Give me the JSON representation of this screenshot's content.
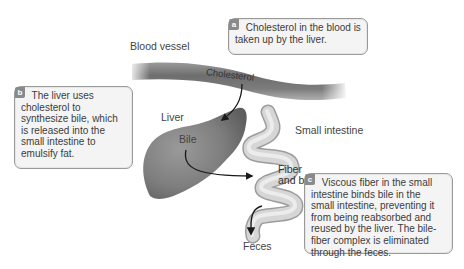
{
  "labels": {
    "blood_vessel": "Blood vessel",
    "cholesterol": "Cholesterol",
    "liver": "Liver",
    "bile": "Bile",
    "small_intestine": "Small intestine",
    "fiber_and_bile_line1": "Fiber",
    "fiber_and_bile_line2": "and bile",
    "feces": "Feces"
  },
  "callouts": {
    "a": {
      "badge": "a",
      "text": "Cholesterol in the blood is taken up by the liver."
    },
    "b": {
      "badge": "b",
      "text": "The liver uses cholesterol to synthesize bile, which is released into the small intestine to emulsify fat."
    },
    "c": {
      "badge": "c",
      "text": "Viscous fiber in the small intestine binds bile in the small intestine, preventing it from being reabsorbed and reused by the liver. The bile-fiber complex is eliminated through the feces."
    }
  },
  "colors": {
    "vessel": "#7a7a7a",
    "liver": "#808080",
    "intestine": "#d2d2d2",
    "badge": "#8a8a8a",
    "box_bg": "#f4f4f4",
    "box_border": "#9a9a9a",
    "arrow": "#1a1a1a"
  }
}
